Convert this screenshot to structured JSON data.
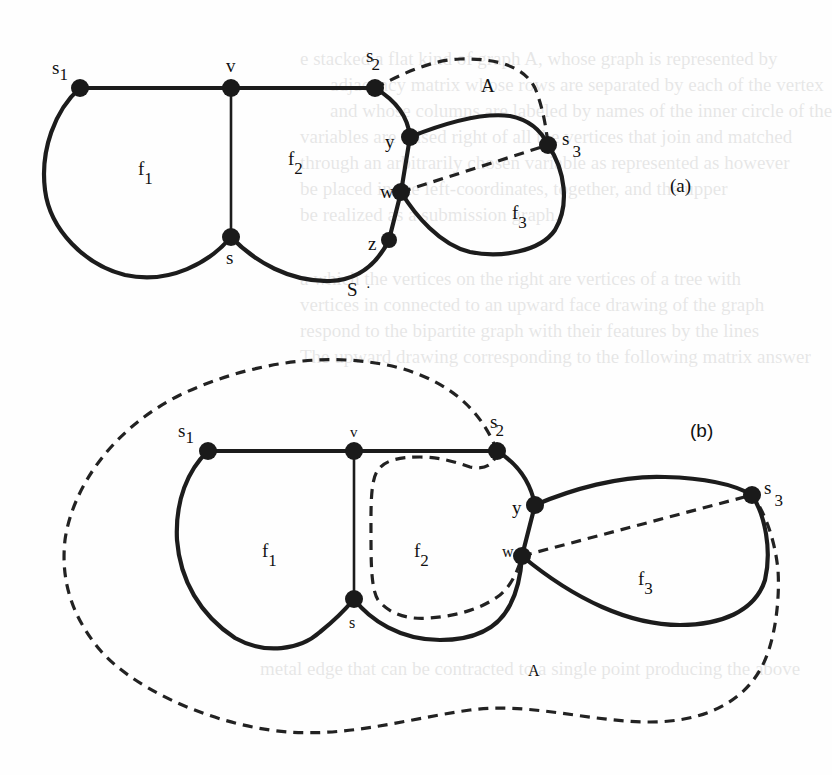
{
  "figure": {
    "background_color": "#fefefe",
    "ink_color": "#1c1c1c",
    "bleed_through_text": [
      "e stacked a flat kind of graph A, whose graph is represented by",
      "adjacency matrix whose rows are separated by each of the vertex",
      "and whose columns are labeled by names of the inner circle of the",
      "variables are raised right of all the vertices that join and matched",
      "through an arbitrarily chosen variable as represented as however",
      "be placed in the left-coordinates, together, and the upper",
      "be realized as a submission graph.",
      "a which the vertices on the right are vertices of a tree with",
      "vertices in connected to an upward face drawing of the graph",
      "respond to the bipartite graph with their features by the lines",
      "The upward drawing corresponding to the following matrix answer",
      "metal edge that can be contracted to a single point producing the above"
    ]
  },
  "diagram_a": {
    "panel_label": "(a)",
    "vertices": [
      {
        "id": "s1",
        "label": "s",
        "sub": "1"
      },
      {
        "id": "v",
        "label": "v",
        "sub": ""
      },
      {
        "id": "s2",
        "label": "s",
        "sub": "2"
      },
      {
        "id": "y",
        "label": "y",
        "sub": ""
      },
      {
        "id": "s3",
        "label": "s",
        "sub": "3"
      },
      {
        "id": "w",
        "label": "w",
        "sub": ""
      },
      {
        "id": "z",
        "label": "z",
        "sub": ""
      },
      {
        "id": "s",
        "label": "s",
        "sub": ""
      }
    ],
    "faces": [
      {
        "label": "f",
        "sub": "1"
      },
      {
        "label": "f",
        "sub": "2"
      },
      {
        "label": "f",
        "sub": "3"
      }
    ],
    "region_label": "A",
    "outer_label": "S",
    "outer_label_dot": "·"
  },
  "diagram_b": {
    "panel_label": "(b)",
    "vertices": [
      {
        "id": "s1",
        "label": "s",
        "sub": "1"
      },
      {
        "id": "v",
        "label": "v",
        "sub": ""
      },
      {
        "id": "s2",
        "label": "s",
        "sub": "2"
      },
      {
        "id": "y",
        "label": "y",
        "sub": ""
      },
      {
        "id": "s3",
        "label": "s",
        "sub": "3"
      },
      {
        "id": "w",
        "label": "w",
        "sub": ""
      },
      {
        "id": "s",
        "label": "s",
        "sub": ""
      }
    ],
    "faces": [
      {
        "label": "f",
        "sub": "1"
      },
      {
        "label": "f",
        "sub": "2"
      },
      {
        "label": "f",
        "sub": "3"
      }
    ],
    "region_label": "A"
  }
}
